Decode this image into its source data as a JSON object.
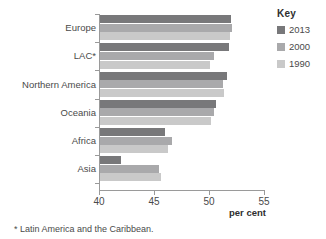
{
  "chart_data": {
    "type": "bar",
    "orientation": "horizontal",
    "title": "",
    "xlabel": "per cent",
    "ylabel": "",
    "xlim": [
      40,
      55
    ],
    "xticks": [
      40,
      45,
      50,
      55
    ],
    "grid": false,
    "categories": [
      "Europe",
      "LAC*",
      "Northern America",
      "Oceania",
      "Africa",
      "Asia"
    ],
    "series": [
      {
        "name": "2013",
        "color": "#78787a",
        "values": [
          51.9,
          51.7,
          51.5,
          50.5,
          45.9,
          41.9
        ]
      },
      {
        "name": "2000",
        "color": "#a9a9ab",
        "values": [
          52.0,
          50.4,
          51.2,
          50.4,
          46.5,
          45.4
        ]
      },
      {
        "name": "1990",
        "color": "#c9c9c9",
        "values": [
          51.8,
          50.0,
          51.3,
          50.1,
          46.2,
          45.5
        ]
      }
    ],
    "legend": {
      "title": "Key",
      "position": "right",
      "entries": [
        {
          "label": "2013",
          "color": "#78787a"
        },
        {
          "label": "2000",
          "color": "#a9a9ab"
        },
        {
          "label": "1990",
          "color": "#c9c9c9"
        }
      ]
    },
    "footnote": "* Latin America and the Caribbean."
  }
}
